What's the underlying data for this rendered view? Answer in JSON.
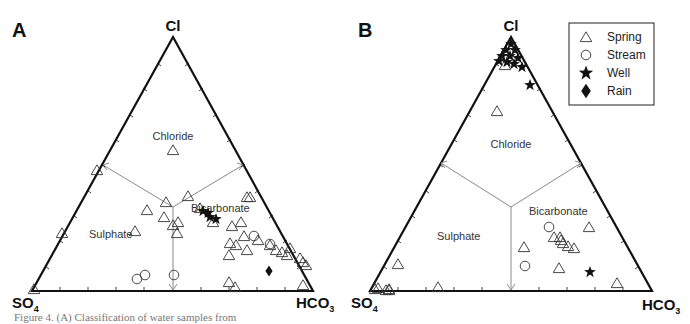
{
  "figure": {
    "caption": "Figure 4. (A) Classification of water samples from",
    "colors": {
      "frame": "#111111",
      "divider": "#8a8a8a",
      "marker_stroke": "#333333",
      "filled": "#111111"
    }
  },
  "chart_data": [
    {
      "type": "ternary-scatter",
      "panel": "A",
      "vertices": {
        "top": "Cl",
        "bottom_left": "SO4",
        "bottom_right": "HCO3"
      },
      "regions": [
        "Chloride",
        "Sulphate",
        "Bicarbonate"
      ],
      "ticks_per_side": 9,
      "legend": null,
      "series": [
        {
          "name": "Spring",
          "marker": "triangle-open",
          "points_xy_px": [
            [
              173,
              150
            ],
            [
              97,
              170
            ],
            [
              62,
              233
            ],
            [
              34,
              289
            ],
            [
              147,
              210
            ],
            [
              166,
              202
            ],
            [
              164,
              217
            ],
            [
              178,
              222
            ],
            [
              173,
              225
            ],
            [
              135,
              231
            ],
            [
              188,
              196
            ],
            [
              177,
              233
            ],
            [
              200,
              208
            ],
            [
              213,
              222
            ],
            [
              232,
              226
            ],
            [
              241,
              222
            ],
            [
              247,
              197
            ],
            [
              250,
              197
            ],
            [
              244,
              236
            ],
            [
              230,
              243
            ],
            [
              236,
              245
            ],
            [
              247,
              250
            ],
            [
              229,
              255
            ],
            [
              258,
              240
            ],
            [
              270,
              245
            ],
            [
              276,
              250
            ],
            [
              282,
              252
            ],
            [
              287,
              255
            ],
            [
              290,
              248
            ],
            [
              300,
              258
            ],
            [
              303,
              262
            ],
            [
              306,
              265
            ],
            [
              229,
              282
            ],
            [
              235,
              287
            ],
            [
              303,
              285
            ]
          ]
        },
        {
          "name": "Stream",
          "marker": "circle-open",
          "points_xy_px": [
            [
              137,
              279
            ],
            [
              145,
              275
            ],
            [
              174,
              275
            ],
            [
              254,
              236
            ],
            [
              270,
              244
            ]
          ]
        },
        {
          "name": "Well",
          "marker": "star-filled",
          "points_xy_px": [
            [
              203,
              211
            ],
            [
              208,
              213
            ],
            [
              210,
              217
            ],
            [
              216,
              219
            ]
          ]
        },
        {
          "name": "Rain",
          "marker": "diamond-filled",
          "points_xy_px": [
            [
              269,
              271
            ]
          ]
        }
      ]
    },
    {
      "type": "ternary-scatter",
      "panel": "B",
      "vertices": {
        "top": "Cl",
        "bottom_left": "SO4",
        "bottom_right": "HCO3"
      },
      "regions": [
        "Chloride",
        "Sulphate",
        "Bicarbonate"
      ],
      "ticks_per_side": 9,
      "legend": {
        "position": "top-right",
        "entries": [
          "Spring",
          "Stream",
          "Well",
          "Rain"
        ]
      },
      "series": [
        {
          "name": "Spring",
          "marker": "triangle-open",
          "points_xy_px": [
            [
              497,
              111
            ],
            [
              505,
              65
            ],
            [
              398,
              264
            ],
            [
              375,
              289
            ],
            [
              378,
              288
            ],
            [
              386,
              290
            ],
            [
              389,
              289
            ],
            [
              389,
              290
            ],
            [
              438,
              287
            ],
            [
              524,
              247
            ],
            [
              554,
              237
            ],
            [
              560,
              237
            ],
            [
              561,
              240
            ],
            [
              563,
              243
            ],
            [
              568,
              246
            ],
            [
              574,
              248
            ],
            [
              589,
              227
            ],
            [
              559,
              268
            ],
            [
              617,
              283
            ]
          ]
        },
        {
          "name": "Stream",
          "marker": "circle-open",
          "points_xy_px": [
            [
              549,
              227
            ],
            [
              525,
              266
            ]
          ]
        },
        {
          "name": "Well",
          "marker": "star-filled",
          "points_xy_px": [
            [
              511,
              44
            ],
            [
              506,
              50
            ],
            [
              515,
              50
            ],
            [
              502,
              56
            ],
            [
              510,
              56
            ],
            [
              518,
              58
            ],
            [
              499,
              61
            ],
            [
              507,
              62
            ],
            [
              514,
              64
            ],
            [
              522,
              67
            ],
            [
              530,
              85
            ],
            [
              590,
              272
            ]
          ]
        },
        {
          "name": "Rain",
          "marker": "diamond-filled",
          "points_xy_px": []
        }
      ]
    }
  ],
  "panels": {
    "A": {
      "letter": "A",
      "top": "Cl",
      "bl_main": "SO",
      "bl_sub": "4",
      "br_main": "HCO",
      "br_sub": "3",
      "region_chloride": "Chloride",
      "region_sulphate": "Sulphate",
      "region_bicarbonate": "Bicarbonate"
    },
    "B": {
      "letter": "B",
      "top": "Cl",
      "bl_main": "SO",
      "bl_sub": "4",
      "br_main": "HCO",
      "br_sub": "3",
      "region_chloride": "Chloride",
      "region_sulphate": "Sulphate",
      "region_bicarbonate": "Bicarbonate"
    }
  },
  "legend": {
    "spring": "Spring",
    "stream": "Stream",
    "well": "Well",
    "rain": "Rain"
  }
}
